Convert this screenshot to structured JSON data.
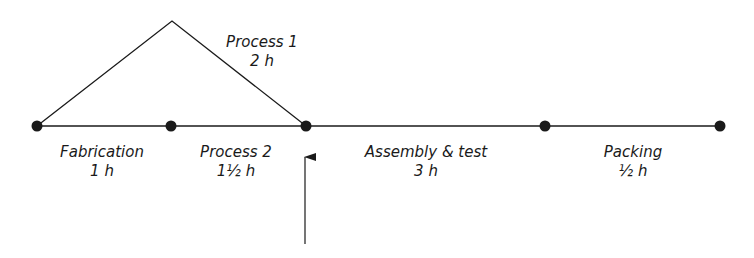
{
  "diagram": {
    "type": "process-timeline",
    "line_color": "#1a1a1a",
    "nodes": [
      {
        "id": "n1",
        "x": 37,
        "y": 126
      },
      {
        "id": "n2",
        "x": 171,
        "y": 126
      },
      {
        "id": "n3",
        "x": 306,
        "y": 126
      },
      {
        "id": "n4",
        "x": 545,
        "y": 126
      },
      {
        "id": "n5",
        "x": 720,
        "y": 126
      }
    ],
    "activities": [
      {
        "name": "Fabrication",
        "duration": "1 h",
        "from": "n1",
        "to": "n2",
        "path": "straight"
      },
      {
        "name": "Process 2",
        "duration": "1½ h",
        "from": "n2",
        "to": "n3",
        "path": "straight"
      },
      {
        "name": "Process 1",
        "duration": "2 h",
        "from": "n1",
        "to": "n3",
        "path": "via-apex",
        "apex": {
          "x": 172,
          "y": 21
        }
      },
      {
        "name": "Assembly & test",
        "duration": "3 h",
        "from": "n3",
        "to": "n4",
        "path": "straight"
      },
      {
        "name": "Packing",
        "duration": "½ h",
        "from": "n4",
        "to": "n5",
        "path": "straight"
      }
    ],
    "pointer_arrow": {
      "x": 305,
      "from_y": 244,
      "to_y": 155,
      "points_to": "n3"
    }
  }
}
